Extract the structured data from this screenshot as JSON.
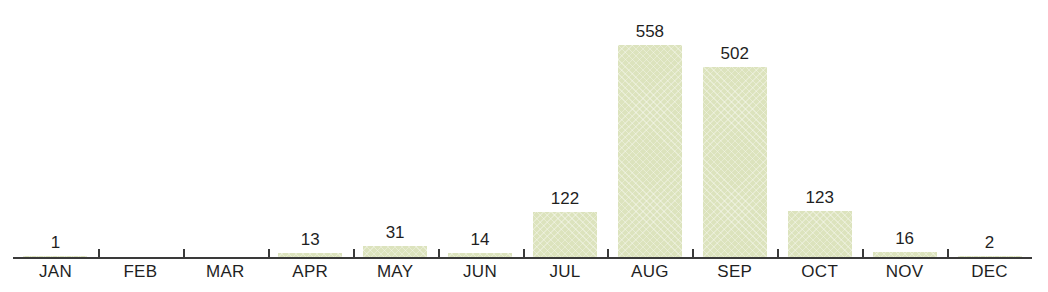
{
  "title_remnant": "",
  "axis": {
    "baseline_color": "#3a3a3a",
    "tick_count": 11
  },
  "style": {
    "bar_color": "#dce3bd",
    "label_color": "#1f1f1f",
    "background": "#ffffff"
  },
  "chart_data": {
    "type": "bar",
    "title": "",
    "xlabel": "",
    "ylabel": "",
    "categories": [
      "JAN",
      "FEB",
      "MAR",
      "APR",
      "MAY",
      "JUN",
      "JUL",
      "AUG",
      "SEP",
      "OCT",
      "NOV",
      "DEC"
    ],
    "values": [
      1,
      0,
      0,
      13,
      31,
      14,
      122,
      558,
      502,
      123,
      16,
      2
    ],
    "value_labels": [
      "1",
      "",
      "",
      "13",
      "31",
      "14",
      "122",
      "558",
      "502",
      "123",
      "16",
      "2"
    ],
    "ylim": [
      0,
      640
    ],
    "grid": false,
    "legend": null,
    "bar_color": "#dce3bd"
  }
}
